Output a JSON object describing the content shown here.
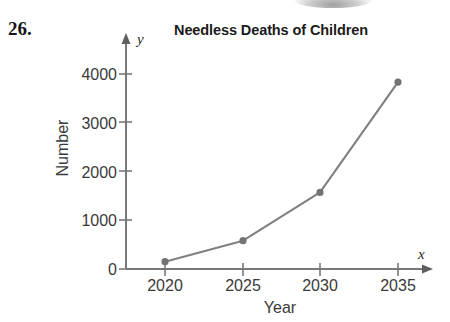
{
  "problem": {
    "number": "26."
  },
  "chart_data": {
    "type": "line",
    "title": "Needless Deaths of Children",
    "xlabel": "Year",
    "ylabel": "Number",
    "x_axis_symbol": "x",
    "y_axis_symbol": "y",
    "categories": [
      "2020",
      "2025",
      "2030",
      "2035"
    ],
    "x": [
      2020,
      2025,
      2030,
      2035
    ],
    "values": [
      150,
      580,
      1570,
      3830
    ],
    "xticklabels": [
      "2020",
      "2025",
      "2030",
      "2035"
    ],
    "yticklabels": [
      "0",
      "1000",
      "2000",
      "3000",
      "4000"
    ],
    "yticks": [
      0,
      1000,
      2000,
      3000,
      4000
    ],
    "xlim": [
      2018.2,
      2037.5
    ],
    "ylim": [
      0,
      4500
    ],
    "grid": false,
    "legend": null,
    "series": [
      {
        "name": "Needless deaths of children",
        "values": [
          150,
          580,
          1570,
          3830
        ]
      }
    ],
    "marker": "circle",
    "line_color": "#808080",
    "marker_color": "#737373",
    "axis_color": "#6e6e6e",
    "text_color": "#3a3a3a",
    "title_color": "#1a1a1a"
  }
}
